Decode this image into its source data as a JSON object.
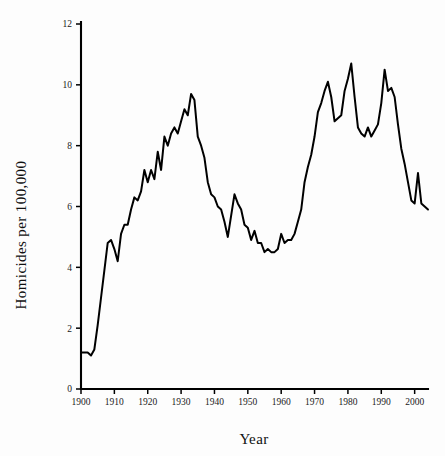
{
  "chart_data": {
    "type": "line",
    "title": "",
    "xlabel": "Year",
    "ylabel": "Homicides per 100,000",
    "xlim": [
      1900,
      2004
    ],
    "ylim": [
      0,
      12
    ],
    "grid": false,
    "legend": null,
    "xticks": [
      1900,
      1910,
      1920,
      1930,
      1940,
      1950,
      1960,
      1970,
      1980,
      1990,
      2000
    ],
    "xtick_labels": [
      "1900",
      "1910",
      "1920",
      "1930",
      "1940",
      "1950",
      "1960",
      "1970",
      "1980",
      "1990",
      "2000"
    ],
    "yticks": [
      0,
      2,
      4,
      6,
      8,
      10,
      12
    ],
    "ytick_labels": [
      "0",
      "2",
      "4",
      "6",
      "8",
      "10",
      "12"
    ],
    "series": [
      {
        "name": "Homicide rate",
        "color": "#000000",
        "x": [
          1900,
          1901,
          1902,
          1903,
          1904,
          1905,
          1906,
          1907,
          1908,
          1909,
          1910,
          1911,
          1912,
          1913,
          1914,
          1915,
          1916,
          1917,
          1918,
          1919,
          1920,
          1921,
          1922,
          1923,
          1924,
          1925,
          1926,
          1927,
          1928,
          1929,
          1930,
          1931,
          1932,
          1933,
          1934,
          1935,
          1936,
          1937,
          1938,
          1939,
          1940,
          1941,
          1942,
          1943,
          1944,
          1945,
          1946,
          1947,
          1948,
          1949,
          1950,
          1951,
          1952,
          1953,
          1954,
          1955,
          1956,
          1957,
          1958,
          1959,
          1960,
          1961,
          1962,
          1963,
          1964,
          1965,
          1966,
          1967,
          1968,
          1969,
          1970,
          1971,
          1972,
          1973,
          1974,
          1975,
          1976,
          1977,
          1978,
          1979,
          1980,
          1981,
          1982,
          1983,
          1984,
          1985,
          1986,
          1987,
          1988,
          1989,
          1990,
          1991,
          1992,
          1993,
          1994,
          1995,
          1996,
          1997,
          1998,
          1999,
          2000,
          2001,
          2002,
          2003,
          2004
        ],
        "y": [
          1.2,
          1.2,
          1.2,
          1.1,
          1.3,
          2.1,
          3.0,
          3.9,
          4.8,
          4.9,
          4.6,
          4.2,
          5.1,
          5.4,
          5.4,
          5.9,
          6.3,
          6.2,
          6.5,
          7.2,
          6.8,
          7.2,
          6.9,
          7.8,
          7.2,
          8.3,
          8.0,
          8.4,
          8.6,
          8.4,
          8.8,
          9.2,
          9.0,
          9.7,
          9.5,
          8.3,
          8.0,
          7.6,
          6.8,
          6.4,
          6.3,
          6.0,
          5.9,
          5.5,
          5.0,
          5.7,
          6.4,
          6.1,
          5.9,
          5.4,
          5.3,
          4.9,
          5.2,
          4.8,
          4.8,
          4.5,
          4.6,
          4.5,
          4.5,
          4.6,
          5.1,
          4.8,
          4.9,
          4.9,
          5.1,
          5.5,
          5.9,
          6.8,
          7.3,
          7.7,
          8.3,
          9.1,
          9.4,
          9.8,
          10.1,
          9.6,
          8.8,
          8.9,
          9.0,
          9.8,
          10.2,
          10.7,
          9.6,
          8.6,
          8.4,
          8.3,
          8.6,
          8.3,
          8.5,
          8.7,
          9.4,
          10.5,
          9.8,
          9.9,
          9.6,
          8.7,
          7.9,
          7.4,
          6.8,
          6.2,
          6.1,
          7.1,
          6.1,
          6.0,
          5.9
        ]
      }
    ]
  },
  "axes": {
    "y_title": "Homicides per 100,000",
    "x_title": "Year"
  }
}
